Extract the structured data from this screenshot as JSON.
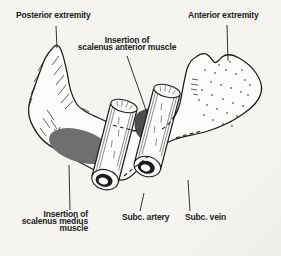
{
  "figure": {
    "title_semantic": "First rib superior view with subclavian vessels",
    "colors": {
      "paper": "#f5f4f1",
      "ink": "#1d1d1d",
      "text": "#222222",
      "bone": "#fcfcfa",
      "medius_insertion": "#6f6f6f",
      "anterior_insertion": "#4d4d4d"
    }
  },
  "labels": {
    "posterior_extremity": "Posterior extremity",
    "anterior_extremity": "Anterior extremity",
    "insertion_anterior": "Insertion of\nscalenus anterior muscle",
    "insertion_medius": "Insertion of\nscalenus medius\nmuscle",
    "subc_artery": "Subc. artery",
    "subc_vein": "Subc. vein"
  }
}
